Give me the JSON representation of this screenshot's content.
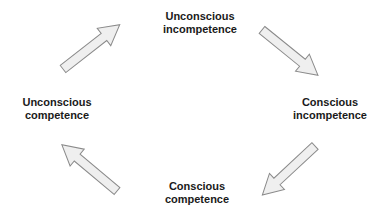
{
  "diagram": {
    "type": "cycle",
    "stages": [
      {
        "id": "unconscious-incompetence",
        "line1": "Unconscious",
        "line2": "incompetence"
      },
      {
        "id": "conscious-incompetence",
        "line1": "Conscious",
        "line2": "incompetence"
      },
      {
        "id": "conscious-competence",
        "line1": "Conscious",
        "line2": "competence"
      },
      {
        "id": "unconscious-competence",
        "line1": "Unconscious",
        "line2": "competence"
      }
    ],
    "arrows": [
      {
        "from": "unconscious-competence",
        "to": "unconscious-incompetence",
        "direction": "up-right"
      },
      {
        "from": "unconscious-incompetence",
        "to": "conscious-incompetence",
        "direction": "down-right"
      },
      {
        "from": "conscious-incompetence",
        "to": "conscious-competence",
        "direction": "down-left"
      },
      {
        "from": "conscious-competence",
        "to": "unconscious-competence",
        "direction": "up-left"
      }
    ],
    "colors": {
      "arrow_fill": "#efefef",
      "arrow_stroke": "#8a8a8a",
      "text": "#1a1a1a",
      "background": "#ffffff"
    }
  }
}
